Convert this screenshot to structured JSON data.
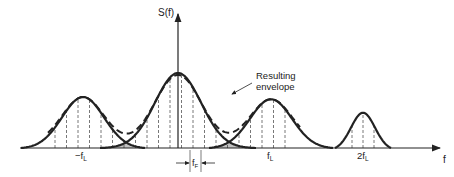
{
  "diagram": {
    "y_axis_label": "S(f)",
    "x_axis_label": "f",
    "annotation": [
      "Resulting",
      "envelope"
    ],
    "tick_labels": {
      "neg_fl": "−f",
      "neg_fl_sub": "L",
      "fl": "f",
      "fl_sub": "L",
      "two_fl": "2f",
      "two_fl_sub": "L"
    },
    "spacing_label": "f",
    "spacing_label_sub": "F",
    "lobes": [
      {
        "name": "lobe-minus-fl",
        "center": "-fL",
        "relative_height": 0.68
      },
      {
        "name": "lobe-center",
        "center": "0",
        "relative_height": 1.0
      },
      {
        "name": "lobe-fl",
        "center": "fL",
        "relative_height": 0.65
      },
      {
        "name": "lobe-2fl",
        "center": "2fL",
        "relative_height": 0.47
      }
    ]
  }
}
